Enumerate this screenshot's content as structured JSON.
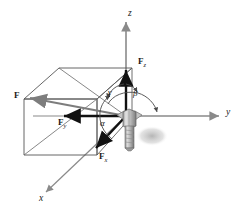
{
  "figure": {
    "kind": "force-vector-decomposition",
    "axes": [
      {
        "name": "z-axis-label",
        "label": "z",
        "x": 128,
        "y": 9
      },
      {
        "name": "y-axis-label",
        "label": "y",
        "x": 226,
        "y": 112
      },
      {
        "name": "x-axis-label",
        "label": "x",
        "x": 39,
        "y": 197
      }
    ],
    "vectors": [
      {
        "name": "force-resultant-label",
        "label": "F",
        "sub": "",
        "x": 14,
        "y": 91
      },
      {
        "name": "force-z-label",
        "label": "F",
        "sub": "z",
        "x": 138,
        "y": 59
      },
      {
        "name": "force-y-label",
        "label": "F",
        "sub": "y",
        "x": 58,
        "y": 119
      },
      {
        "name": "force-x-label",
        "label": "F",
        "sub": "x",
        "x": 99,
        "y": 154
      }
    ],
    "angles": [
      {
        "name": "angle-alpha-label",
        "label": "α",
        "x": 100,
        "y": 121
      },
      {
        "name": "angle-beta-label",
        "label": "β",
        "x": 133,
        "y": 92
      },
      {
        "name": "angle-gamma-label",
        "label": "γ",
        "x": 110,
        "y": 91
      }
    ],
    "colors": {
      "axis": "#8a8a8a",
      "box": "#555555",
      "vector": "#111111",
      "arc": "#4a4a4a",
      "bolt_light": "#d8d8d8",
      "bolt_mid": "#a9a9a9",
      "bolt_dark": "#6f6f6f",
      "shadow": "#b8b8b8"
    }
  }
}
